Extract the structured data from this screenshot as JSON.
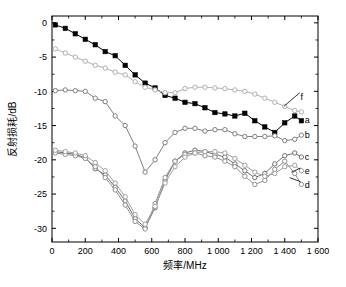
{
  "chart_data": {
    "type": "line",
    "title": "",
    "xlabel": "频率/MHz",
    "ylabel": "反射损耗/dB",
    "xlim": [
      0,
      1600
    ],
    "ylim": [
      -32,
      1
    ],
    "grid": false,
    "legend_position": "right-inline",
    "xticks": [
      "0",
      "200",
      "400",
      "600",
      "800",
      "1 000",
      "1 200",
      "1 400",
      "1 600"
    ],
    "xtick_values": [
      0,
      200,
      400,
      600,
      800,
      1000,
      1200,
      1400,
      1600
    ],
    "yticks": [
      "0",
      "-5",
      "-10",
      "-15",
      "-20",
      "-25",
      "-30"
    ],
    "ytick_values": [
      0,
      -5,
      -10,
      -15,
      -20,
      -25,
      -30
    ],
    "x": [
      20,
      80,
      140,
      200,
      260,
      320,
      380,
      440,
      500,
      560,
      620,
      680,
      740,
      800,
      860,
      920,
      980,
      1040,
      1100,
      1160,
      1220,
      1280,
      1340,
      1400,
      1460,
      1500
    ],
    "series": [
      {
        "name": "a",
        "label": "a",
        "marker": "filled-square",
        "color": "#000000",
        "label_x": 1520,
        "label_y": -14.2,
        "values": [
          -0.3,
          -0.8,
          -1.6,
          -2.4,
          -3.2,
          -4.2,
          -4.8,
          -6.2,
          -7.6,
          -8.8,
          -9.5,
          -10.6,
          -11.0,
          -11.6,
          -11.8,
          -12.4,
          -13.1,
          -13.3,
          -13.6,
          -13.2,
          -14.3,
          -15.2,
          -16.0,
          -14.6,
          -13.6,
          -14.3
        ]
      },
      {
        "name": "b",
        "label": "b",
        "marker": "open-circle",
        "color": "#808080",
        "label_x": 1520,
        "label_y": -16.4,
        "values": [
          -9.9,
          -9.8,
          -9.9,
          -10.0,
          -11.0,
          -11.5,
          -13.6,
          -15.0,
          -18.0,
          -21.8,
          -20.0,
          -17.5,
          -16.0,
          -15.4,
          -15.4,
          -15.8,
          -15.6,
          -15.6,
          -16.2,
          -16.6,
          -16.6,
          -16.6,
          -16.5,
          -17.2,
          -17.0,
          -16.4
        ]
      },
      {
        "name": "c",
        "label": "c",
        "marker": "open-circle",
        "color": "#707070",
        "label_x": 1520,
        "label_y": -19.6,
        "values": [
          -18.8,
          -19.0,
          -19.2,
          -19.7,
          -21.3,
          -22.2,
          -24.0,
          -26.0,
          -28.6,
          -29.9,
          -27.0,
          -23.0,
          -20.2,
          -19.0,
          -18.6,
          -18.8,
          -19.2,
          -19.6,
          -20.6,
          -21.6,
          -22.6,
          -22.0,
          -20.6,
          -19.4,
          -19.0,
          -19.6
        ]
      },
      {
        "name": "d",
        "label": "d",
        "marker": "open-circle",
        "color": "#909090",
        "label_x": 1520,
        "label_y": -23.6,
        "values": [
          -19.0,
          -19.2,
          -19.4,
          -19.8,
          -21.0,
          -22.6,
          -24.4,
          -26.6,
          -29.0,
          -30.1,
          -26.4,
          -22.6,
          -20.2,
          -19.2,
          -19.0,
          -19.4,
          -19.6,
          -20.2,
          -21.0,
          -22.4,
          -23.6,
          -23.0,
          -21.4,
          -20.2,
          -22.0,
          -23.6
        ]
      },
      {
        "name": "e",
        "label": "e",
        "marker": "open-circle",
        "color": "#a0a0a0",
        "label_x": 1520,
        "label_y": -21.6,
        "values": [
          -18.6,
          -18.8,
          -19.0,
          -19.4,
          -20.4,
          -21.6,
          -23.4,
          -25.4,
          -28.0,
          -29.4,
          -26.8,
          -23.4,
          -21.0,
          -19.6,
          -19.0,
          -18.8,
          -18.8,
          -19.0,
          -19.8,
          -20.8,
          -21.8,
          -22.4,
          -22.0,
          -21.0,
          -20.8,
          -21.6
        ]
      },
      {
        "name": "f",
        "label": "f",
        "marker": "open-circle",
        "color": "#b0b0b0",
        "label_x": 1495,
        "label_y": -10.8,
        "values": [
          -3.8,
          -4.4,
          -5.0,
          -5.6,
          -6.2,
          -6.6,
          -7.2,
          -7.6,
          -8.6,
          -9.4,
          -9.8,
          -10.2,
          -10.2,
          -9.6,
          -9.4,
          -9.4,
          -9.5,
          -9.6,
          -9.8,
          -10.0,
          -10.4,
          -11.0,
          -11.6,
          -12.2,
          -12.8,
          -13.0
        ]
      }
    ],
    "annotations": [
      {
        "text": "f",
        "type": "series-callout"
      },
      {
        "text": "a",
        "type": "series-callout"
      },
      {
        "text": "b",
        "type": "series-callout"
      },
      {
        "text": "c",
        "type": "series-callout"
      },
      {
        "text": "e",
        "type": "series-callout"
      },
      {
        "text": "d",
        "type": "series-callout"
      }
    ]
  }
}
